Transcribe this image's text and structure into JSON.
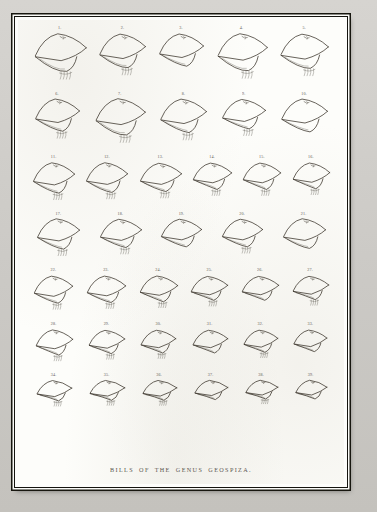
{
  "plate": {
    "caption": "BILLS OF THE GENUS GEOSPIZA.",
    "subject": "finch-bill-profiles",
    "total_figures": 39,
    "frame_style": "double-rule",
    "ink_color": "#383229",
    "paper_color": "#fdfdfa",
    "mount_color": "#cfcdc9"
  },
  "rows": [
    {
      "row_index": 1,
      "figures": [
        {
          "number": "1.",
          "width": 56,
          "height": 56,
          "depth": "very-deep",
          "gape": "wide",
          "has_tongue_hatch": true
        },
        {
          "number": "2.",
          "width": 50,
          "height": 52,
          "depth": "deep",
          "gape": "wide",
          "has_tongue_hatch": true
        },
        {
          "number": "3.",
          "width": 48,
          "height": 50,
          "depth": "deep",
          "gape": "medium",
          "has_tongue_hatch": false
        },
        {
          "number": "4.",
          "width": 54,
          "height": 55,
          "depth": "very-deep",
          "gape": "wide",
          "has_tongue_hatch": true
        },
        {
          "number": "5.",
          "width": 52,
          "height": 53,
          "depth": "deep",
          "gape": "wide",
          "has_tongue_hatch": true
        }
      ]
    },
    {
      "row_index": 2,
      "figures": [
        {
          "number": "6.",
          "width": 48,
          "height": 50,
          "depth": "deep",
          "gape": "medium",
          "has_tongue_hatch": true
        },
        {
          "number": "7.",
          "width": 54,
          "height": 54,
          "depth": "very-deep",
          "gape": "wide",
          "has_tongue_hatch": true
        },
        {
          "number": "8.",
          "width": 50,
          "height": 52,
          "depth": "deep",
          "gape": "medium",
          "has_tongue_hatch": true
        },
        {
          "number": "9.",
          "width": 47,
          "height": 48,
          "depth": "medium",
          "gape": "medium",
          "has_tongue_hatch": true
        },
        {
          "number": "10.",
          "width": 50,
          "height": 51,
          "depth": "deep",
          "gape": "medium",
          "has_tongue_hatch": false
        }
      ]
    },
    {
      "row_index": 3,
      "figures": [
        {
          "number": "11.",
          "width": 45,
          "height": 47,
          "depth": "deep",
          "gape": "medium",
          "has_tongue_hatch": true
        },
        {
          "number": "12.",
          "width": 45,
          "height": 46,
          "depth": "deep",
          "gape": "medium",
          "has_tongue_hatch": true
        },
        {
          "number": "13.",
          "width": 45,
          "height": 46,
          "depth": "medium",
          "gape": "medium",
          "has_tongue_hatch": true
        },
        {
          "number": "14.",
          "width": 42,
          "height": 43,
          "depth": "medium",
          "gape": "narrow",
          "has_tongue_hatch": true
        },
        {
          "number": "15.",
          "width": 41,
          "height": 43,
          "depth": "medium",
          "gape": "narrow",
          "has_tongue_hatch": true
        },
        {
          "number": "16.",
          "width": 40,
          "height": 42,
          "depth": "medium",
          "gape": "narrow",
          "has_tongue_hatch": true
        }
      ]
    },
    {
      "row_index": 4,
      "figures": [
        {
          "number": "17.",
          "width": 46,
          "height": 47,
          "depth": "deep",
          "gape": "medium",
          "has_tongue_hatch": true
        },
        {
          "number": "18.",
          "width": 45,
          "height": 46,
          "depth": "medium",
          "gape": "medium",
          "has_tongue_hatch": true
        },
        {
          "number": "19.",
          "width": 44,
          "height": 45,
          "depth": "medium",
          "gape": "medium",
          "has_tongue_hatch": false
        },
        {
          "number": "20.",
          "width": 44,
          "height": 45,
          "depth": "medium",
          "gape": "medium",
          "has_tongue_hatch": true
        },
        {
          "number": "21.",
          "width": 46,
          "height": 46,
          "depth": "deep",
          "gape": "medium",
          "has_tongue_hatch": false
        }
      ]
    },
    {
      "row_index": 5,
      "figures": [
        {
          "number": "22.",
          "width": 42,
          "height": 44,
          "depth": "medium",
          "gape": "medium",
          "has_tongue_hatch": true
        },
        {
          "number": "23.",
          "width": 42,
          "height": 43,
          "depth": "medium",
          "gape": "medium",
          "has_tongue_hatch": true
        },
        {
          "number": "24.",
          "width": 41,
          "height": 42,
          "depth": "medium",
          "gape": "narrow",
          "has_tongue_hatch": true
        },
        {
          "number": "25.",
          "width": 40,
          "height": 41,
          "depth": "shallow",
          "gape": "narrow",
          "has_tongue_hatch": true
        },
        {
          "number": "26.",
          "width": 40,
          "height": 41,
          "depth": "shallow",
          "gape": "narrow",
          "has_tongue_hatch": false
        },
        {
          "number": "27.",
          "width": 39,
          "height": 40,
          "depth": "shallow",
          "gape": "narrow",
          "has_tongue_hatch": true
        }
      ]
    },
    {
      "row_index": 6,
      "figures": [
        {
          "number": "28.",
          "width": 40,
          "height": 41,
          "depth": "medium",
          "gape": "narrow",
          "has_tongue_hatch": true
        },
        {
          "number": "29.",
          "width": 39,
          "height": 40,
          "depth": "shallow",
          "gape": "narrow",
          "has_tongue_hatch": true
        },
        {
          "number": "30.",
          "width": 38,
          "height": 39,
          "depth": "shallow",
          "gape": "narrow",
          "has_tongue_hatch": true
        },
        {
          "number": "31.",
          "width": 38,
          "height": 39,
          "depth": "shallow",
          "gape": "narrow",
          "has_tongue_hatch": false
        },
        {
          "number": "32.",
          "width": 37,
          "height": 38,
          "depth": "shallow",
          "gape": "narrow",
          "has_tongue_hatch": true
        },
        {
          "number": "33.",
          "width": 36,
          "height": 37,
          "depth": "shallow",
          "gape": "narrow",
          "has_tongue_hatch": false
        }
      ]
    },
    {
      "row_index": 7,
      "figures": [
        {
          "number": "34.",
          "width": 38,
          "height": 37,
          "depth": "slender",
          "gape": "narrow",
          "has_tongue_hatch": true
        },
        {
          "number": "35.",
          "width": 38,
          "height": 36,
          "depth": "slender",
          "gape": "narrow",
          "has_tongue_hatch": true
        },
        {
          "number": "36.",
          "width": 37,
          "height": 36,
          "depth": "slender",
          "gape": "narrow",
          "has_tongue_hatch": true
        },
        {
          "number": "37.",
          "width": 36,
          "height": 35,
          "depth": "slender",
          "gape": "narrow",
          "has_tongue_hatch": false
        },
        {
          "number": "38.",
          "width": 35,
          "height": 34,
          "depth": "slender",
          "gape": "narrow",
          "has_tongue_hatch": true
        },
        {
          "number": "39.",
          "width": 34,
          "height": 34,
          "depth": "slender",
          "gape": "narrow",
          "has_tongue_hatch": false
        }
      ]
    }
  ]
}
